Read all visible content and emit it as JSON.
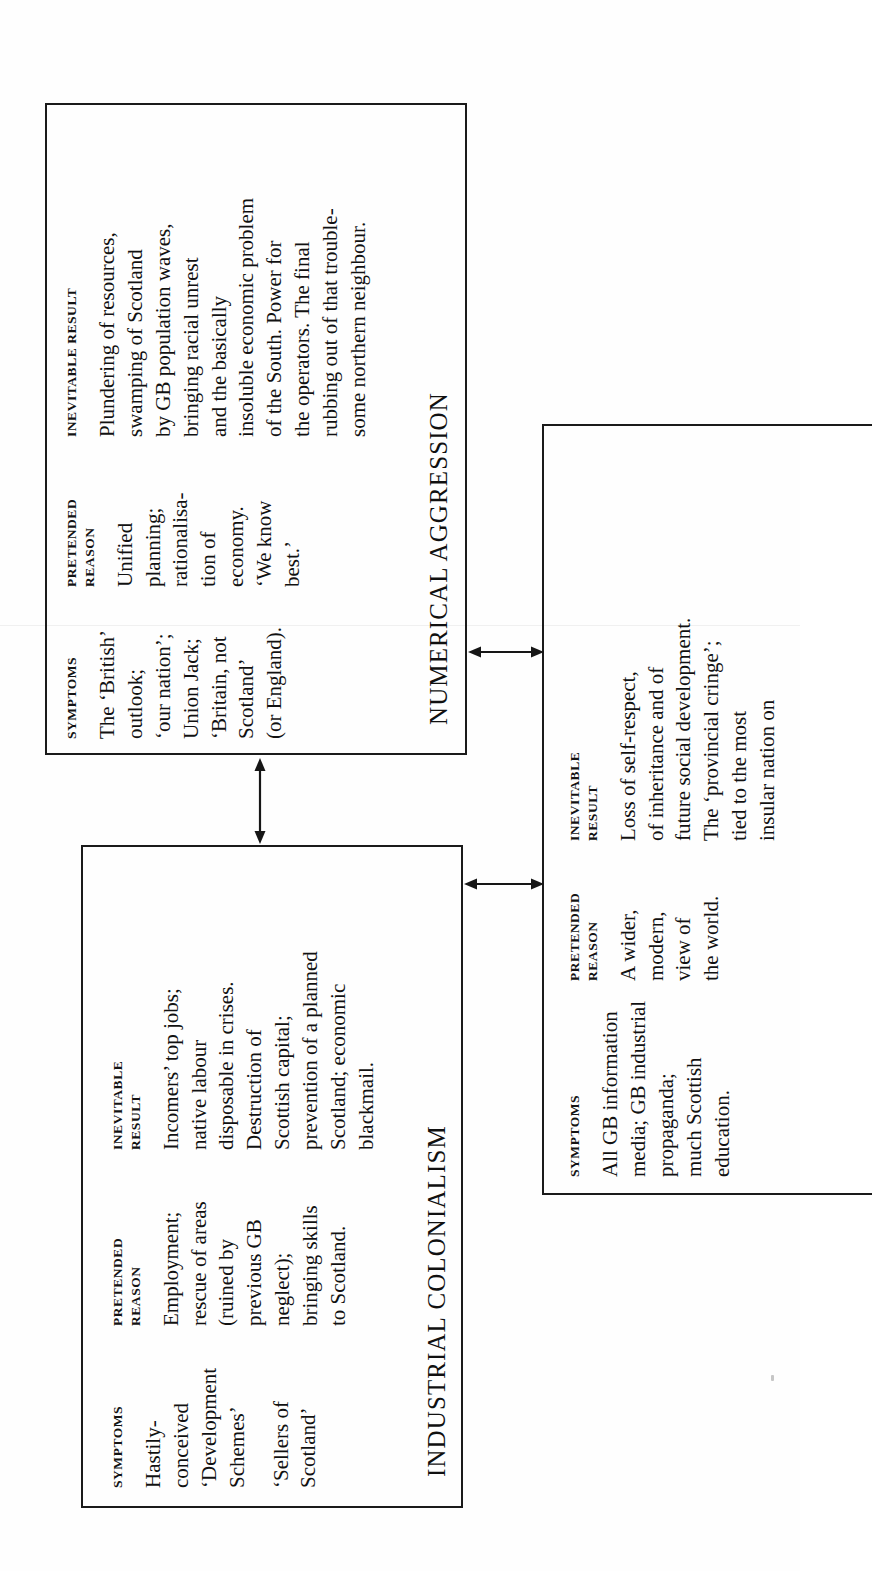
{
  "page": {
    "background": "#fefefe",
    "ink": "#141414",
    "orientation": "rotated-90-ccw"
  },
  "column_headers": {
    "symptoms": "SYMPTOMS",
    "pretended_reason": "PRETENDED\nREASON",
    "inevitable_result": "INEVITABLE\nRESULT"
  },
  "boxes": [
    {
      "id": "numerical-aggression",
      "title": "NUMERICAL AGGRESSION",
      "columns": {
        "symptoms": {
          "header": "SYMPTOMS",
          "body": "The ‘British’\noutlook;\n‘our nation’;\nUnion Jack;\n‘Britain, not\nScotland’\n(or England)."
        },
        "pretended_reason": {
          "header": "PRETENDED\nREASON",
          "body": "Unified\nplanning;\nrationalisa-\ntion of\neconomy.\n‘We know\nbest.’"
        },
        "inevitable_result": {
          "header": "INEVITABLE RESULT",
          "body": "Plundering of resources,\nswamping of Scotland\nby GB population waves,\nbringing racial unrest\nand the basically\ninsoluble economic problem\nof the South. Power for\nthe operators. The final\nrubbing out of that trouble-\nsome northern neighbour."
        }
      }
    },
    {
      "id": "industrial-colonialism",
      "title": "INDUSTRIAL COLONIALISM",
      "columns": {
        "symptoms": {
          "header": "SYMPTOMS",
          "body": "Hastily-\nconceived\n‘Development\nSchemes’",
          "body2": "‘Sellers of\nScotland’"
        },
        "pretended_reason": {
          "header": "PRETENDED\nREASON",
          "body": "Employment;\nrescue of areas\n(ruined by\nprevious GB\nneglect);\nbringing skills\nto Scotland."
        },
        "inevitable_result": {
          "header": "INEVITABLE\nRESULT",
          "body": "Incomers’ top jobs;\nnative labour\ndisposable in crises.\nDestruction of\nScottish capital;\nprevention of a planned\nScotland; economic\nblackmail."
        }
      }
    },
    {
      "id": "cultural-colonialism",
      "title": "",
      "columns": {
        "symptoms": {
          "header": "SYMPTOMS",
          "body": "All GB information\nmedia; GB industrial\npropaganda;\nmuch Scottish\neducation."
        },
        "pretended_reason": {
          "header": "PRETENDED\nREASON",
          "body": "A wider,\nmodern,\nview of\nthe world."
        },
        "inevitable_result": {
          "header": "INEVITABLE\nRESULT",
          "body": "Loss of self-respect,\nof inheritance and of\nfuture social development.\nThe ‘provincial cringe’;\ntied to the most\ninsular nation on"
        }
      }
    }
  ],
  "connectors": [
    {
      "id": "top-to-middle",
      "type": "double-headed-arrow",
      "direction": "vertical"
    },
    {
      "id": "top-to-right",
      "type": "double-headed-arrow",
      "direction": "horizontal"
    },
    {
      "id": "middle-to-right",
      "type": "double-headed-arrow",
      "direction": "horizontal"
    }
  ]
}
